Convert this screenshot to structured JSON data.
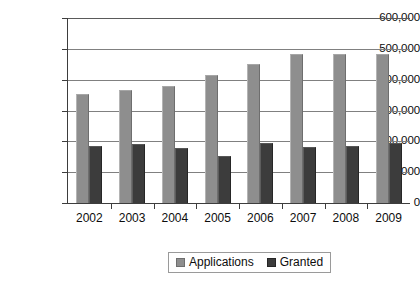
{
  "chart_data": {
    "type": "bar",
    "title": "",
    "subtitle": "",
    "xlabel": "",
    "ylabel": "",
    "categories": [
      "2002",
      "2003",
      "2004",
      "2005",
      "2006",
      "2007",
      "2008",
      "2009"
    ],
    "series": [
      {
        "name": "Applications",
        "color": "#8e8e8e",
        "values": [
          355000,
          365000,
          380000,
          415000,
          450000,
          483000,
          483000,
          482000
        ]
      },
      {
        "name": "Granted",
        "color": "#3c3c3c",
        "values": [
          184000,
          190000,
          178000,
          153000,
          196000,
          180000,
          184000,
          194000
        ]
      }
    ],
    "ylim": [
      0,
      600000
    ],
    "ytick_values": [
      0,
      100000,
      200000,
      300000,
      400000,
      500000,
      600000
    ],
    "ytick_labels": [
      "0",
      "100,000",
      "200,000",
      "300,000",
      "400,000",
      "500,000",
      "600,000"
    ],
    "grid": true,
    "grid_axis": "y",
    "legend_position": "bottom",
    "legend_entries": [
      "Applications",
      "Granted"
    ]
  }
}
